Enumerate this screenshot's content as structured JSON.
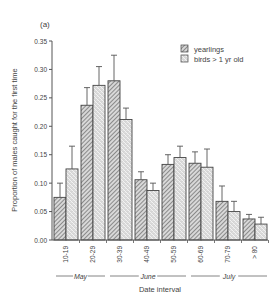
{
  "panel_label": "(a)",
  "chart_data": {
    "type": "bar",
    "title": "",
    "xlabel": "Date interval",
    "ylabel": "Proportion of males caught for the first time",
    "ylim": [
      0,
      0.35
    ],
    "yticks": [
      "0.00",
      "0.05",
      "0.10",
      "0.15",
      "0.20",
      "0.25",
      "0.30",
      "0.35"
    ],
    "categories": [
      "10-19",
      "20-29",
      "30-39",
      "40-49",
      "50-59",
      "60-69",
      "70-79",
      "> 80"
    ],
    "months": [
      {
        "label": "May",
        "from": 0,
        "to": 2
      },
      {
        "label": "June",
        "from": 2,
        "to": 5
      },
      {
        "label": "July",
        "from": 5,
        "to": 8
      }
    ],
    "legend_position": "upper right",
    "series": [
      {
        "name": "yearlings",
        "pattern": "hatch",
        "values": [
          0.075,
          0.237,
          0.28,
          0.106,
          0.133,
          0.135,
          0.068,
          0.037
        ],
        "error_upper": [
          0.1,
          0.268,
          0.325,
          0.12,
          0.15,
          0.155,
          0.095,
          0.045
        ]
      },
      {
        "name": "birds > 1 yr old",
        "pattern": "dots",
        "values": [
          0.125,
          0.272,
          0.212,
          0.087,
          0.145,
          0.128,
          0.05,
          0.028
        ],
        "error_upper": [
          0.165,
          0.305,
          0.232,
          0.1,
          0.165,
          0.16,
          0.068,
          0.04
        ]
      }
    ]
  }
}
